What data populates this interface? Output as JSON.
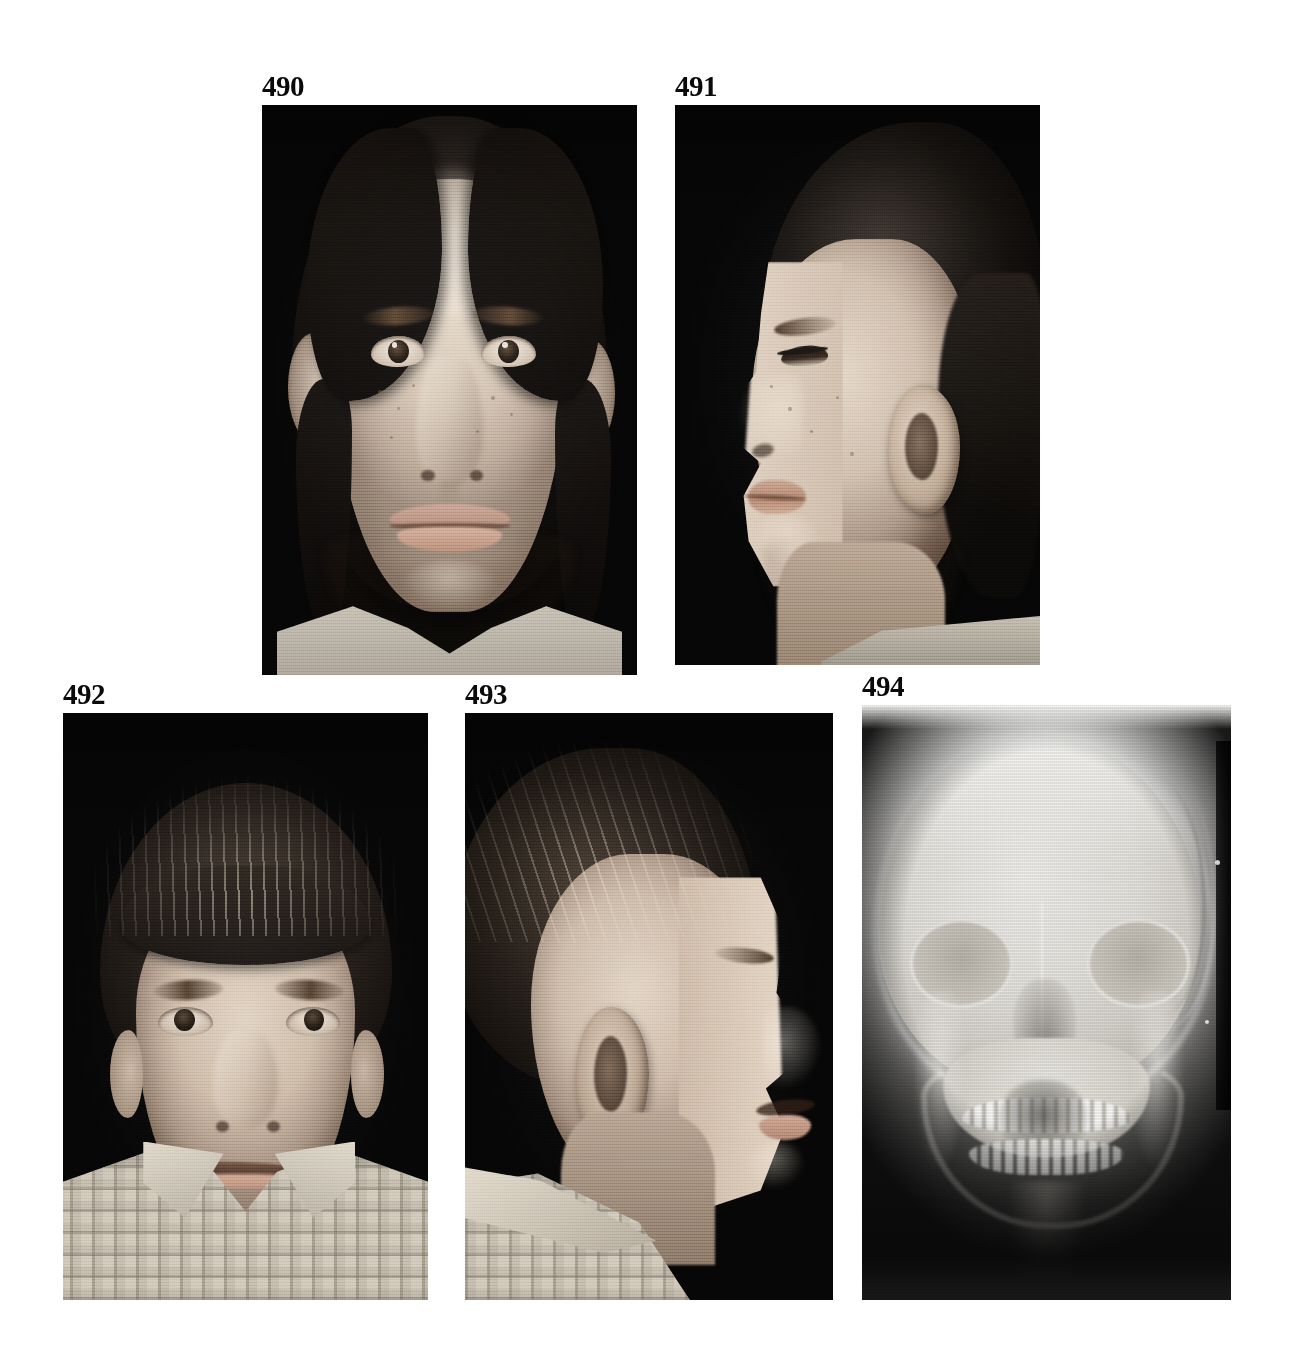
{
  "plate": {
    "background_color": "#ffffff",
    "width": 1298,
    "height": 1355,
    "label_color": "#0a0a0a"
  },
  "figures": [
    {
      "id": "490",
      "label": "490",
      "kind": "clinical-photograph",
      "view": "frontal",
      "subject": "adolescent girl",
      "background_color": "#050505",
      "x": 262,
      "y": 105,
      "width": 375,
      "height": 570
    },
    {
      "id": "491",
      "label": "491",
      "kind": "clinical-photograph",
      "view": "lateral-profile",
      "subject": "adolescent girl",
      "background_color": "#050505",
      "x": 675,
      "y": 105,
      "width": 365,
      "height": 560
    },
    {
      "id": "492",
      "label": "492",
      "kind": "clinical-photograph",
      "view": "frontal",
      "subject": "young boy in checked shirt",
      "background_color": "#050505",
      "x": 63,
      "y": 713,
      "width": 365,
      "height": 587
    },
    {
      "id": "493",
      "label": "493",
      "kind": "clinical-photograph",
      "view": "lateral-profile",
      "subject": "young boy in checked shirt",
      "background_color": "#050505",
      "x": 465,
      "y": 713,
      "width": 368,
      "height": 587
    },
    {
      "id": "494",
      "label": "494",
      "kind": "radiograph",
      "view": "anteroposterior-skull",
      "subject": "skull radiograph",
      "background_color": "#f2f2ef",
      "x": 862,
      "y": 705,
      "width": 369,
      "height": 595
    }
  ]
}
